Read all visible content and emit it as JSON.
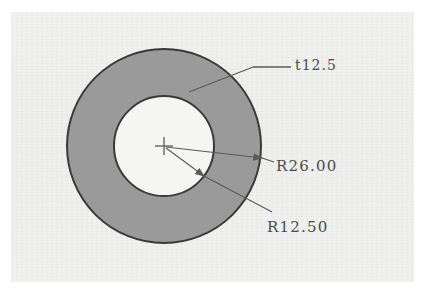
{
  "document": {
    "type": "scanned-engineering-drawing",
    "subject": "annular ring / washer cross-section",
    "background_color": "#f1f1f0",
    "paper_border_color": "#ffffff"
  },
  "drawing": {
    "outline_color": "#3a3a3a",
    "fill_color": "#9a9a9a",
    "inner_fill_color": "#f5f5f4",
    "leader_color": "#5a5a5a",
    "center_marker": {
      "name": "center-cross",
      "x": 164,
      "y": 146,
      "arm_length": 9
    },
    "outer_circle": {
      "name": "outer-circle",
      "cx": 164,
      "cy": 146,
      "r": 97
    },
    "inner_circle": {
      "name": "inner-circle",
      "cx": 164,
      "cy": 146,
      "r": 50
    }
  },
  "annotations": {
    "thickness": {
      "label": "t12.5",
      "value": 12.5,
      "prefix": "t",
      "meaning": "plate thickness"
    },
    "outer_radius": {
      "label": "R26.00",
      "value": 26.0,
      "prefix": "R",
      "meaning": "outer radius"
    },
    "inner_radius": {
      "label": "R12.50",
      "value": 12.5,
      "prefix": "R",
      "meaning": "inner radius"
    }
  }
}
